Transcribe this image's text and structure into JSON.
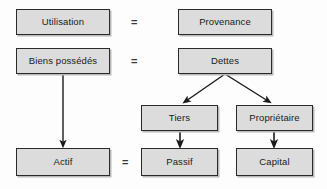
{
  "diagram": {
    "background_color": "#fdfdfd",
    "box_fill_color": "#dcdcdc",
    "box_border_color": "#2a2a2a",
    "text_color": "#1a1a1a",
    "arrow_color": "#1a1a1a",
    "nodes": [
      {
        "id": "utilisation",
        "label": "Utilisation",
        "x": 16,
        "y": 9,
        "w": 94,
        "h": 26
      },
      {
        "id": "provenance",
        "label": "Provenance",
        "x": 178,
        "y": 9,
        "w": 94,
        "h": 26
      },
      {
        "id": "biens",
        "label": "Biens possédés",
        "x": 16,
        "y": 48,
        "w": 94,
        "h": 26
      },
      {
        "id": "dettes",
        "label": "Dettes",
        "x": 178,
        "y": 48,
        "w": 94,
        "h": 26
      },
      {
        "id": "tiers",
        "label": "Tiers",
        "x": 141,
        "y": 105,
        "w": 77,
        "h": 26
      },
      {
        "id": "proprietaire",
        "label": "Propriétaire",
        "x": 236,
        "y": 105,
        "w": 77,
        "h": 26
      },
      {
        "id": "actif",
        "label": "Actif",
        "x": 16,
        "y": 148,
        "w": 94,
        "h": 28
      },
      {
        "id": "passif",
        "label": "Passif",
        "x": 141,
        "y": 148,
        "w": 77,
        "h": 28
      },
      {
        "id": "capital",
        "label": "Capital",
        "x": 236,
        "y": 148,
        "w": 77,
        "h": 28
      }
    ],
    "equals_signs": [
      {
        "id": "equals-row-1",
        "label": "=",
        "x": 131,
        "y": 17
      },
      {
        "id": "equals-row-2",
        "label": "=",
        "x": 131,
        "y": 56
      },
      {
        "id": "equals-row-3",
        "label": "=",
        "x": 122,
        "y": 157
      }
    ],
    "edges": [
      {
        "id": "biens-to-actif",
        "from": "biens",
        "to": "actif",
        "kind": "straight-vertical",
        "x1": 63,
        "y1": 74,
        "x2": 63,
        "y2": 146
      },
      {
        "id": "dettes-to-tiers",
        "from": "dettes",
        "to": "tiers",
        "kind": "diagonal",
        "x1": 225,
        "y1": 74,
        "x2": 184,
        "y2": 103
      },
      {
        "id": "dettes-to-proprietaire",
        "from": "dettes",
        "to": "proprietaire",
        "kind": "diagonal",
        "x1": 225,
        "y1": 74,
        "x2": 270,
        "y2": 103
      },
      {
        "id": "tiers-to-passif",
        "from": "tiers",
        "to": "passif",
        "kind": "straight-vertical",
        "x1": 180,
        "y1": 131,
        "x2": 180,
        "y2": 146
      },
      {
        "id": "proprietaire-to-capital",
        "from": "proprietaire",
        "to": "capital",
        "kind": "straight-vertical",
        "x1": 274,
        "y1": 131,
        "x2": 274,
        "y2": 146
      }
    ]
  }
}
